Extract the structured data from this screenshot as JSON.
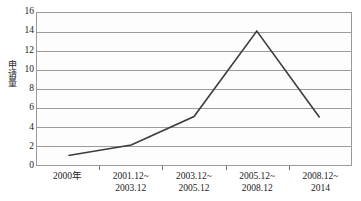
{
  "chart_data": {
    "type": "line",
    "title": "",
    "xlabel": "",
    "ylabel": "申请量",
    "categories": [
      "2000年",
      "2001.12~\n2003.12",
      "2003.12~\n2005.12",
      "2005.12~\n2008.12",
      "2008.12~\n2014"
    ],
    "category_lines": [
      [
        "2000年",
        ""
      ],
      [
        "2001.12~",
        "2003.12"
      ],
      [
        "2003.12~",
        "2005.12"
      ],
      [
        "2005.12~",
        "2008.12"
      ],
      [
        "2008.12~",
        "2014"
      ]
    ],
    "values": [
      1,
      2.1,
      5.1,
      14.1,
      5
    ],
    "series": [
      {
        "name": "申请量",
        "values": [
          1,
          2.1,
          5.1,
          14.1,
          5
        ]
      }
    ],
    "ylim": [
      0,
      16
    ],
    "ytick_step": 2,
    "yticks": [
      0,
      2,
      4,
      6,
      8,
      10,
      12,
      14,
      16
    ],
    "ytick_labels": [
      "0",
      "2",
      "4",
      "6",
      "8",
      "10",
      "12",
      "14",
      "16"
    ],
    "grid": true,
    "grid_axis": "y",
    "legend": false,
    "legend_position": "none",
    "marker": "none",
    "colors": {
      "line": "#3d3d3d",
      "grid": "#9a9a9a",
      "frame": "#9a9a9a",
      "plot_background": "#fdfdfd",
      "text": "#1a1a1a"
    }
  }
}
